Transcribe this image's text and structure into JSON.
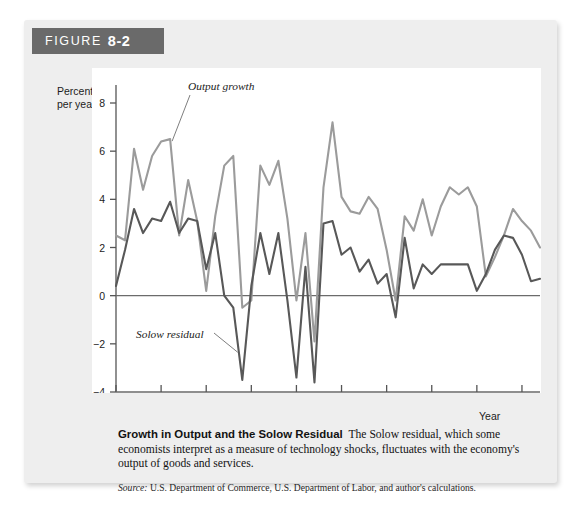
{
  "figure": {
    "banner_word": "FIGURE",
    "banner_number": "8-2"
  },
  "axes": {
    "y_title_line1": "Percent",
    "y_title_line2": "per year",
    "x_title": "Year"
  },
  "caption": {
    "title": "Growth in Output and the Solow Residual",
    "body": "The Solow residual, which some economists interpret as a measure of technology shocks, fluctuates with the economy's output of goods and services.",
    "source_label": "Source:",
    "source_body": "U.S. Department of Commerce, U.S. Department of Labor, and author's calculations."
  },
  "annotations": {
    "output_growth": "Output growth",
    "solow_residual": "Solow residual"
  },
  "colors": {
    "output_growth_line": "#9b9b9b",
    "solow_residual_line": "#585858",
    "panel_background": "#eeeeee",
    "plot_background": "#ffffff",
    "banner_background": "#6a6a6a",
    "axis": "#555555"
  },
  "chart_data": {
    "type": "line",
    "title": "Growth in Output and the Solow Residual",
    "xlabel": "Year",
    "ylabel": "Percent per year",
    "xlim": [
      1960,
      2007
    ],
    "ylim": [
      -4,
      8
    ],
    "yticks": [
      8,
      6,
      4,
      2,
      0,
      -2,
      -4
    ],
    "ytick_labels": [
      "8",
      "6",
      "4",
      "2",
      "0",
      "−2",
      "−4"
    ],
    "xticks": [
      1960,
      1965,
      1970,
      1975,
      1980,
      1985,
      1990,
      1995,
      2000,
      2005
    ],
    "xtick_labels": [
      "1960",
      "1965",
      "1970",
      "1975",
      "1980",
      "1985",
      "1990",
      "1995",
      "2000",
      "2005"
    ],
    "grid": false,
    "legend": "inline annotations",
    "zero_line": true,
    "x": [
      1960,
      1961,
      1962,
      1963,
      1964,
      1965,
      1966,
      1967,
      1968,
      1969,
      1970,
      1971,
      1972,
      1973,
      1974,
      1975,
      1976,
      1977,
      1978,
      1979,
      1980,
      1981,
      1982,
      1983,
      1984,
      1985,
      1986,
      1987,
      1988,
      1989,
      1990,
      1991,
      1992,
      1993,
      1994,
      1995,
      1996,
      1997,
      1998,
      1999,
      2000,
      2001,
      2002,
      2003,
      2004,
      2005,
      2006,
      2007
    ],
    "series": [
      {
        "name": "Output growth",
        "color": "#9b9b9b",
        "values": [
          2.5,
          2.3,
          6.1,
          4.4,
          5.8,
          6.4,
          6.5,
          2.5,
          4.8,
          3.1,
          0.2,
          3.3,
          5.4,
          5.8,
          -0.5,
          -0.2,
          5.4,
          4.6,
          5.6,
          3.2,
          -0.2,
          2.6,
          -1.9,
          4.5,
          7.2,
          4.1,
          3.5,
          3.4,
          4.1,
          3.6,
          1.9,
          -0.2,
          3.3,
          2.7,
          4.0,
          2.5,
          3.7,
          4.5,
          4.2,
          4.5,
          3.7,
          0.8,
          1.6,
          2.5,
          3.6,
          3.1,
          2.7,
          2.0
        ]
      },
      {
        "name": "Solow residual",
        "color": "#585858",
        "values": [
          0.4,
          1.9,
          3.6,
          2.6,
          3.2,
          3.1,
          3.9,
          2.6,
          3.2,
          3.1,
          1.1,
          2.6,
          0.0,
          -0.5,
          -3.5,
          0.4,
          2.6,
          0.9,
          2.6,
          -0.2,
          -3.4,
          1.2,
          -3.6,
          3.0,
          3.1,
          1.7,
          2.0,
          1.0,
          1.5,
          0.5,
          0.9,
          -0.9,
          2.4,
          0.3,
          1.3,
          0.9,
          1.3,
          1.3,
          1.3,
          1.3,
          0.2,
          0.9,
          1.9,
          2.5,
          2.4,
          1.7,
          0.6,
          0.7
        ]
      }
    ]
  }
}
